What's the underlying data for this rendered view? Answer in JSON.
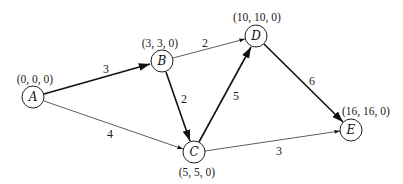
{
  "diagram": {
    "type": "directed weighted graph (shortest path / critical path network)",
    "nodes": [
      {
        "id": "A",
        "label": "A",
        "annotation": "(0, 0, 0)"
      },
      {
        "id": "B",
        "label": "B",
        "annotation": "(3, 3, 0)"
      },
      {
        "id": "C",
        "label": "C",
        "annotation": "(5, 5, 0)"
      },
      {
        "id": "D",
        "label": "D",
        "annotation": "(10, 10, 0)"
      },
      {
        "id": "E",
        "label": "E",
        "annotation": "(16, 16, 0)"
      }
    ],
    "edges": [
      {
        "from": "A",
        "to": "B",
        "weight": "3",
        "bold": true
      },
      {
        "from": "A",
        "to": "C",
        "weight": "4",
        "bold": false
      },
      {
        "from": "B",
        "to": "D",
        "weight": "2",
        "bold": false
      },
      {
        "from": "B",
        "to": "C",
        "weight": "2",
        "bold": true
      },
      {
        "from": "C",
        "to": "D",
        "weight": "5",
        "bold": true
      },
      {
        "from": "C",
        "to": "E",
        "weight": "3",
        "bold": false
      },
      {
        "from": "D",
        "to": "E",
        "weight": "6",
        "bold": true
      }
    ]
  }
}
